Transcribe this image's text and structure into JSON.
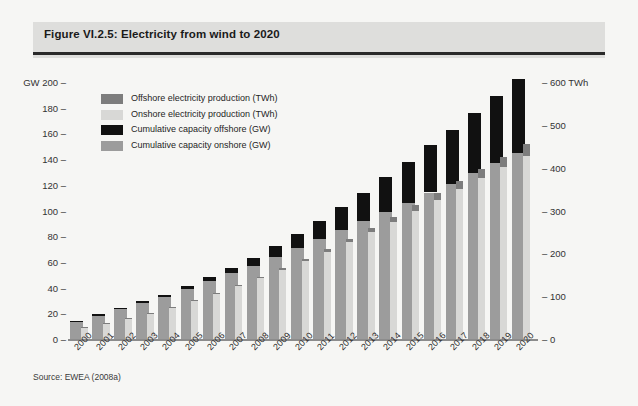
{
  "figure": {
    "title": "Figure VI.2.5: Electricity from wind to 2020",
    "source": "Source: EWEA (2008a)"
  },
  "colors": {
    "offshore_production": "#7d7d7d",
    "onshore_production": "#d8d8d6",
    "capacity_offshore": "#111111",
    "capacity_onshore": "#9c9c9c",
    "title_band": "#dededc",
    "background": "#f6f6f4"
  },
  "legend": {
    "position": "top-left-inside",
    "items": [
      {
        "label": "Offshore electricity production (TWh)",
        "color": "#7d7d7d"
      },
      {
        "label": "Onshore electricity production (TWh)",
        "color": "#d8d8d6"
      },
      {
        "label": "Cumulative capacity offshore (GW)",
        "color": "#111111"
      },
      {
        "label": "Cumulative capacity onshore (GW)",
        "color": "#9c9c9c"
      }
    ]
  },
  "chart_data": {
    "type": "bar",
    "title": "Figure VI.2.5: Electricity from wind to 2020",
    "subtitle": "",
    "xlabel": "",
    "ylabel": "GW",
    "ylabel_right": "TWh",
    "ylim": [
      0,
      200
    ],
    "ylim_right": [
      0,
      600
    ],
    "grid": false,
    "stacked": true,
    "legend_position": "upper left",
    "categories": [
      "2000",
      "2001",
      "2002",
      "2003",
      "2004",
      "2005",
      "2006",
      "2007",
      "2008",
      "2009",
      "2010",
      "2011",
      "2012",
      "2013",
      "2014",
      "2015",
      "2016",
      "2017",
      "2018",
      "2019",
      "2020"
    ],
    "yticks_left": [
      0,
      20,
      40,
      60,
      80,
      100,
      120,
      140,
      160,
      180,
      200
    ],
    "yticks_right": [
      0,
      100,
      200,
      300,
      400,
      500,
      600
    ],
    "series": [
      {
        "name": "Cumulative capacity onshore (GW)",
        "unit": "GW",
        "axis": "left",
        "color": "#9c9c9c",
        "values": [
          13,
          18,
          23,
          28,
          33,
          39,
          45,
          51,
          57,
          64,
          71,
          78,
          85,
          92,
          99,
          106,
          114,
          121,
          129,
          137,
          145
        ]
      },
      {
        "name": "Cumulative capacity offshore (GW)",
        "unit": "GW",
        "axis": "left",
        "color": "#111111",
        "values": [
          0.3,
          0.5,
          0.7,
          1,
          1.5,
          2,
          3,
          4,
          6,
          8,
          11,
          14,
          18,
          22,
          27,
          32,
          37,
          42,
          47,
          52,
          57
        ]
      },
      {
        "name": "Onshore electricity production (TWh)",
        "unit": "TWh",
        "axis": "right",
        "color": "#d8d8d6",
        "values": [
          26,
          36,
          48,
          60,
          74,
          90,
          106,
          124,
          142,
          162,
          182,
          204,
          226,
          250,
          274,
          298,
          324,
          350,
          376,
          402,
          428
        ]
      },
      {
        "name": "Offshore electricity production (TWh)",
        "unit": "TWh",
        "axis": "right",
        "color": "#7d7d7d",
        "values": [
          1,
          2,
          3,
          4,
          6,
          8,
          11,
          15,
          21,
          28,
          38,
          50,
          64,
          80,
          98,
          117,
          137,
          157,
          178,
          199,
          221
        ]
      }
    ],
    "totals_gw": [
      13,
      19,
      24,
      29,
      35,
      41,
      48,
      55,
      63,
      72,
      82,
      92,
      103,
      114,
      126,
      138,
      151,
      163,
      176,
      189,
      202
    ]
  }
}
